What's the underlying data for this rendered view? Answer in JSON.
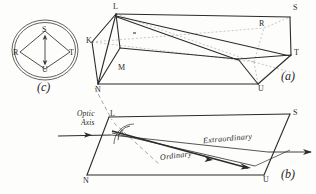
{
  "figure": {
    "ink_color": "#2b2b2b",
    "dashed_color": "#9a9a9a",
    "background_color": "#fdfdfc"
  },
  "panel_a": {
    "caption": "(a)",
    "vertices": [
      {
        "name": "K",
        "label": "K"
      },
      {
        "name": "L",
        "label": "L"
      },
      {
        "name": "M",
        "label": "M"
      },
      {
        "name": "N",
        "label": "N"
      },
      {
        "name": "R",
        "label": "R"
      },
      {
        "name": "S",
        "label": "S"
      },
      {
        "name": "T",
        "label": "T"
      },
      {
        "name": "U",
        "label": "U"
      }
    ]
  },
  "panel_b": {
    "caption": "(b)",
    "optic_axis_label_line1": "Optic",
    "optic_axis_label_line2": "Axis",
    "angle_label": "α",
    "ray_extraordinary": "Extraordinary",
    "ray_ordinary": "Ordinary",
    "vertices": [
      {
        "name": "L",
        "label": "L"
      },
      {
        "name": "N",
        "label": "N"
      },
      {
        "name": "S",
        "label": "S"
      },
      {
        "name": "U",
        "label": "U"
      }
    ]
  },
  "panel_c": {
    "caption": "(c)",
    "vertices": [
      {
        "name": "S",
        "label": "S"
      },
      {
        "name": "R",
        "label": "R"
      },
      {
        "name": "T",
        "label": "T"
      },
      {
        "name": "U",
        "label": "U"
      }
    ]
  }
}
